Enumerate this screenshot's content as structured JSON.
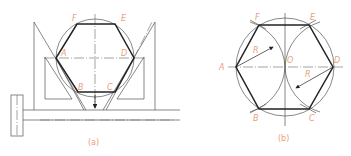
{
  "figure_a": {
    "caption": "(a)",
    "labels": {
      "A": "A",
      "B": "B",
      "C": "C",
      "D": "D",
      "E": "E",
      "F": "F"
    }
  },
  "figure_b": {
    "caption": "(b)",
    "labels": {
      "A": "A",
      "B": "B",
      "C": "C",
      "D": "D",
      "E": "E",
      "F": "F",
      "O": "O",
      "R1": "R",
      "R2": "R"
    }
  },
  "colors": {
    "label": "#e8a07a",
    "line": "#222222"
  }
}
